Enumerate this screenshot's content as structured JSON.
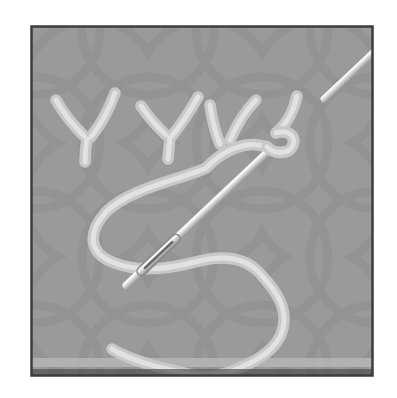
{
  "illustration": {
    "subject": "Fly stitch embroidery step diagram",
    "description": "Three V-shaped fly stitches worked in pale thread on grey lattice-patterned fabric; a steel needle emerges through the fabric over the working thread, which trails downward in a loose S curve.",
    "stitch_type": "fly stitch",
    "stitch_count": 3,
    "elements": {
      "fabric": "grey fabric with interlocking-circle lattice weave",
      "stitches": "row of three V-shaped fly stitches with anchoring tails",
      "working_thread": "loose pale thread looping under the needle and trailing off the bottom edge",
      "needle": "diagonal steel needle, point entered at upper right, eye end emerging at lower left"
    }
  },
  "colors": {
    "page": "#ffffff",
    "frame": "#3d3d3d",
    "fabric": "#9a9a9a",
    "pattern": "#8b8b8b",
    "band": "#b6b6b6",
    "shadow_edge": "#4a4a4a",
    "thread_base": "#c8c8c8",
    "thread_highlight": "#e2e2e2",
    "needle_edge": "#8a8a8a",
    "needle_mid": "#d2d2d2",
    "needle_highlight": "#ffffff",
    "needle_eye": "#4f4f4f"
  }
}
